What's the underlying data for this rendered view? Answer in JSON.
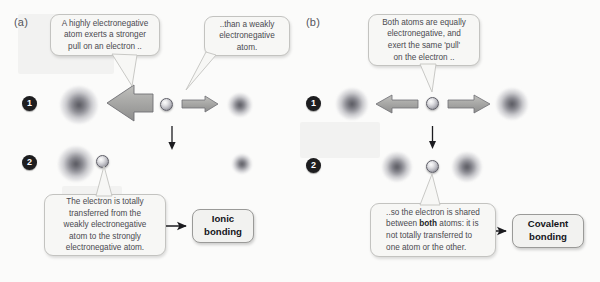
{
  "figure": {
    "panels": [
      {
        "id": "a",
        "letter": "(a)",
        "steps": [
          {
            "number": "1"
          },
          {
            "number": "2"
          }
        ],
        "callouts": [
          {
            "id": "a-strong-pull",
            "text": "A highly electronegative atom exerts a stronger pull on an electron ..",
            "lines": [
              "A highly electronegative",
              "atom exerts a stronger",
              "pull on an electron .."
            ]
          },
          {
            "id": "a-weak-pull",
            "text": ".. than a weakly electronegative atom.",
            "lines": [
              "..than a weakly",
              "electronegative",
              "atom."
            ]
          },
          {
            "id": "a-transfer",
            "text": "The electron is totally transferred from the weakly electronegative atom to the strongly electronegative atom.",
            "lines": [
              "The electron is totally",
              "transferred from the",
              "weakly electronegative",
              "atom to the strongly",
              "electronegative atom."
            ]
          }
        ],
        "result": {
          "label": "Ionic bonding",
          "lines": [
            "Ionic",
            "bonding"
          ]
        },
        "force_arrows": [
          {
            "direction": "left",
            "strength": "strong",
            "label": "strong-pull-arrow"
          },
          {
            "direction": "right",
            "strength": "weak",
            "label": "weak-pull-arrow"
          }
        ],
        "atoms": [
          {
            "name": "strongly-electronegative-atom",
            "size": "large"
          },
          {
            "name": "weakly-electronegative-atom",
            "size": "small"
          }
        ],
        "electron": {
          "name": "electron",
          "step1_position": "center",
          "step2_position": "near-strong-atom"
        }
      },
      {
        "id": "b",
        "letter": "(b)",
        "steps": [
          {
            "number": "1"
          },
          {
            "number": "2"
          }
        ],
        "callouts": [
          {
            "id": "b-equal-pull",
            "text": "Both atoms are equally electronegative, and exert the same 'pull' on the electron ..",
            "lines": [
              "Both atoms are equally",
              "electronegative, and",
              "exert the same 'pull'",
              "on the electron .."
            ]
          },
          {
            "id": "b-shared",
            "text": ".. so the electron is shared between both atoms: it is not totally transferred to one atom or the other.",
            "lines_rich": [
              [
                {
                  "t": "..so the electron is shared"
                }
              ],
              [
                {
                  "t": "between "
                },
                {
                  "t": "both",
                  "bold": true
                },
                {
                  "t": " atoms: it is"
                }
              ],
              [
                {
                  "t": "not totally transferred to"
                }
              ],
              [
                {
                  "t": "one atom or the other."
                }
              ]
            ]
          }
        ],
        "result": {
          "label": "Covalent bonding",
          "lines": [
            "Covalent",
            "bonding"
          ]
        },
        "force_arrows": [
          {
            "direction": "left",
            "strength": "equal",
            "label": "equal-pull-arrow-left"
          },
          {
            "direction": "right",
            "strength": "equal",
            "label": "equal-pull-arrow-right"
          }
        ],
        "atoms": [
          {
            "name": "electronegative-atom-left",
            "size": "medium"
          },
          {
            "name": "electronegative-atom-right",
            "size": "medium"
          }
        ],
        "electron": {
          "name": "electron",
          "step1_position": "center",
          "step2_position": "center"
        }
      }
    ],
    "colors": {
      "background": "#fbfbfa",
      "bubble_fill": "#f7f7f5",
      "bubble_border": "#c3c3c0",
      "result_fill": "#f2f2f0",
      "result_border": "#9a9a98",
      "arrow_fill": "#a8a8a6",
      "arrow_stroke": "#6f6f74",
      "text": "#4a4a50",
      "step_disc": "#1d1d1f"
    }
  }
}
